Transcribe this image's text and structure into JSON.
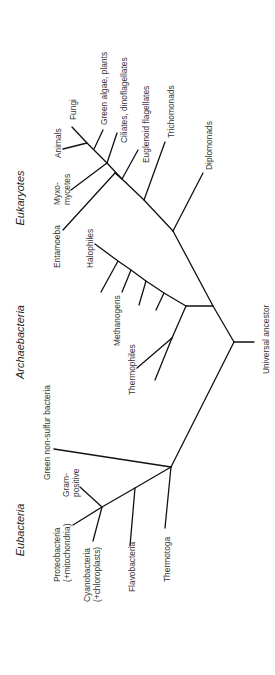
{
  "diagram": {
    "line_color": "#111111",
    "text_color": "#333333"
  },
  "domains": [
    {
      "id": "eukaryotes",
      "label": "Eukaryotes",
      "x": 20,
      "y": 198
    },
    {
      "id": "archaebacteria",
      "label": "Archaebacteria",
      "x": 20,
      "y": 342
    },
    {
      "id": "eubacteria",
      "label": "Eubacteria",
      "x": 20,
      "y": 530
    }
  ],
  "taxa": [
    {
      "id": "fungi",
      "lines": [
        "Fungi"
      ],
      "x": 73,
      "y": 120
    },
    {
      "id": "animals",
      "lines": [
        "Animals"
      ],
      "x": 58,
      "y": 158
    },
    {
      "id": "green-algae-plants",
      "lines": [
        "Green algae, plants"
      ],
      "x": 104,
      "y": 125
    },
    {
      "id": "ciliates-dinoflagellates",
      "lines": [
        "Ciliates, dinoflagellates"
      ],
      "x": 124,
      "y": 143
    },
    {
      "id": "myxomycetes",
      "lines": [
        "Myxo-",
        "mycetes"
      ],
      "x": 57,
      "y": 205
    },
    {
      "id": "euglenoid-flagellates",
      "lines": [
        "Euglenoid flagellates"
      ],
      "x": 146,
      "y": 163
    },
    {
      "id": "trichomonads",
      "lines": [
        "Trichomonads"
      ],
      "x": 171,
      "y": 138
    },
    {
      "id": "entamoeba",
      "lines": [
        "Entamoeba"
      ],
      "x": 57,
      "y": 268
    },
    {
      "id": "diplomonads",
      "lines": [
        "Diplomonads"
      ],
      "x": 209,
      "y": 170
    },
    {
      "id": "halophiles",
      "lines": [
        "Halophiles"
      ],
      "x": 90,
      "y": 268
    },
    {
      "id": "methanogens",
      "lines": [
        "Methanogens"
      ],
      "x": 117,
      "y": 346
    },
    {
      "id": "thermophiles",
      "lines": [
        "Thermophiles"
      ],
      "x": 132,
      "y": 395
    },
    {
      "id": "universal-ancestor",
      "lines": [
        "Universal ancestor"
      ],
      "x": 266,
      "y": 374
    },
    {
      "id": "green-non-sulfur-bacteria",
      "lines": [
        "Green non-sulfur bacteria"
      ],
      "x": 47,
      "y": 480
    },
    {
      "id": "gram-positive",
      "lines": [
        "Gram-",
        "positive"
      ],
      "x": 66,
      "y": 497
    },
    {
      "id": "proteobacteria",
      "lines": [
        "Proteobacteria",
        "(+mitochondria)"
      ],
      "x": 57,
      "y": 582
    },
    {
      "id": "cyanobacteria",
      "lines": [
        "Cyanobacteria",
        "(+chloroplasts)"
      ],
      "x": 87,
      "y": 602
    },
    {
      "id": "flavobacteria",
      "lines": [
        "Flavobacteria"
      ],
      "x": 132,
      "y": 592
    },
    {
      "id": "thermotoga",
      "lines": [
        "Thermotoga"
      ],
      "x": 167,
      "y": 582
    }
  ],
  "branches": [
    {
      "id": "root-stub",
      "d": "M234,342 L254,342"
    },
    {
      "id": "root-to-eukarya-archaea",
      "d": "M234,342 L213,306 L173,231"
    },
    {
      "id": "root-to-bacteria",
      "d": "M234,342 L171,467"
    },
    {
      "id": "euk-spine",
      "d": "M173,231 L144,200 L122,179 L107,163 L87,143 L72,127"
    },
    {
      "id": "diplomonads-branch",
      "d": "M173,231 L203,173"
    },
    {
      "id": "trichomonads-branch",
      "d": "M144,200 L165,142"
    },
    {
      "id": "euglenoid-branch",
      "d": "M122,179 L138,150"
    },
    {
      "id": "entamoeba-branch",
      "d": "M115,173 L63,230"
    },
    {
      "id": "entamoeba-stem",
      "d": "M115,173 L122,179"
    },
    {
      "id": "ciliates-branch",
      "d": "M107,163 L117,133"
    },
    {
      "id": "myxomycetes-branch",
      "d": "M107,163 L71,190"
    },
    {
      "id": "green-algae-branch",
      "d": "M94,149 L103,130"
    },
    {
      "id": "animals-branch",
      "d": "M87,143 L63,149"
    },
    {
      "id": "archaea-stem",
      "d": "M213,306 L186,306"
    },
    {
      "id": "archaea-spine",
      "d": "M186,306 L164,293 L146,281 L131,270 L118,261 L95,244"
    },
    {
      "id": "methanogen-1",
      "d": "M118,261 L101,292"
    },
    {
      "id": "methanogen-2",
      "d": "M131,270 L122,292"
    },
    {
      "id": "methanogen-3",
      "d": "M146,281 L139,305"
    },
    {
      "id": "methanogen-4",
      "d": "M164,293 L156,310"
    },
    {
      "id": "thermophile-stem",
      "d": "M186,306 L172,338"
    },
    {
      "id": "thermophile-1",
      "d": "M172,338 L137,368"
    },
    {
      "id": "thermophile-2",
      "d": "M172,338 L155,380"
    },
    {
      "id": "green-non-sulfur-branch",
      "d": "M171,467 L54,449"
    },
    {
      "id": "thermotoga-branch",
      "d": "M171,467 L165,528"
    },
    {
      "id": "bacteria-spine",
      "d": "M171,467 L135,488 L102,507 L73,525"
    },
    {
      "id": "flavobacteria-branch",
      "d": "M135,488 L130,546"
    },
    {
      "id": "gram-positive-branch",
      "d": "M102,507 L80,487"
    },
    {
      "id": "cyanobacteria-branch",
      "d": "M102,507 L93,541"
    }
  ]
}
